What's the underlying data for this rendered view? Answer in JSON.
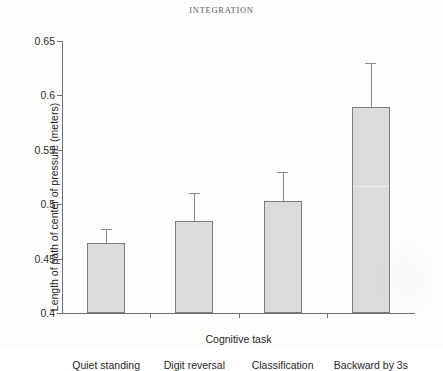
{
  "running_head": "INTEGRATION",
  "chart_data": {
    "type": "bar",
    "title": "",
    "xlabel": "Cognitive task",
    "ylabel": "Length of path of center of pressure (meters)",
    "categories": [
      "Quiet standing",
      "Digit reversal",
      "Classification",
      "Backward by 3s"
    ],
    "values": [
      0.464,
      0.485,
      0.503,
      0.589
    ],
    "errors_upper": [
      0.477,
      0.51,
      0.53,
      0.63
    ],
    "error_magnitudes": [
      0.013,
      0.025,
      0.027,
      0.041
    ],
    "ylim": [
      0.4,
      0.65
    ],
    "yticks": [
      0.4,
      0.45,
      0.5,
      0.55,
      0.6,
      0.65
    ],
    "ytick_labels": [
      "0.4",
      "0.45",
      "0.5",
      "0.55",
      "0.6",
      "0.65"
    ],
    "grid": false,
    "legend": null,
    "error_bar_style": "upper-only-cap",
    "bar_fill_color": "#d9dcda",
    "bar_border_color": "#7c7e7d",
    "axis_color": "#6d6f70"
  }
}
